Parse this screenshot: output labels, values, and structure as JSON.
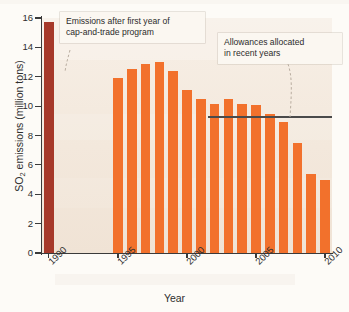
{
  "chart_data": {
    "type": "bar",
    "title": "",
    "xlabel": "Year",
    "ylabel": "SO2 emissions (million tons)",
    "ylabel_display": "SO₂ emissions (million tons)",
    "ylim": [
      0,
      16
    ],
    "ytick_labels": [
      "0",
      "2",
      "4",
      "6",
      "8",
      "10",
      "12",
      "14",
      "16"
    ],
    "ytick_values": [
      0,
      2,
      4,
      6,
      8,
      10,
      12,
      14,
      16
    ],
    "xtick_labels": [
      "1990",
      "1995",
      "2000",
      "2005",
      "2010"
    ],
    "xtick_values": [
      1990,
      1995,
      2000,
      2005,
      2010
    ],
    "grid": false,
    "legend": "none",
    "categories": [
      1990,
      1995,
      1996,
      1997,
      1998,
      1999,
      2000,
      2001,
      2002,
      2003,
      2004,
      2005,
      2006,
      2007,
      2008,
      2009,
      2010
    ],
    "values": [
      15.7,
      11.9,
      12.5,
      12.9,
      13.0,
      12.4,
      11.1,
      10.5,
      10.15,
      10.5,
      10.15,
      10.05,
      9.45,
      8.9,
      7.5,
      5.35,
      5.0
    ],
    "bar_colors": [
      "#A6392A",
      "#F2712C",
      "#F2712C",
      "#F2712C",
      "#F2712C",
      "#F2712C",
      "#F2712C",
      "#F2712C",
      "#F2712C",
      "#F2712C",
      "#F2712C",
      "#F2712C",
      "#F2712C",
      "#F2712C",
      "#F2712C",
      "#F2712C",
      "#F2712C"
    ],
    "reference_line": {
      "label": "Allowances allocated in recent years",
      "value": 9.3,
      "x_start": 2002,
      "x_end": 2010,
      "color": "#4a4a4a"
    },
    "annotations": [
      {
        "id": "cap-and-trade",
        "text": "Emissions after first year of\ncap-and-trade program",
        "points_to_category": 1995
      },
      {
        "id": "allowances",
        "text": "Allowances allocated\nin recent years",
        "points_to_value": 9.3
      }
    ]
  },
  "axes": {
    "y_title": "SO",
    "y_title_sub": "2",
    "y_title_rest": " emissions (million tons)",
    "x_title": "Year"
  },
  "colors": {
    "bar": "#F2712C",
    "bar_highlight": "#A6392A",
    "plot_background": "#f3e8dc",
    "axis": "#3a3a3a",
    "reference_line": "#4a4a4a",
    "callout_background": "#fbf7f1"
  }
}
